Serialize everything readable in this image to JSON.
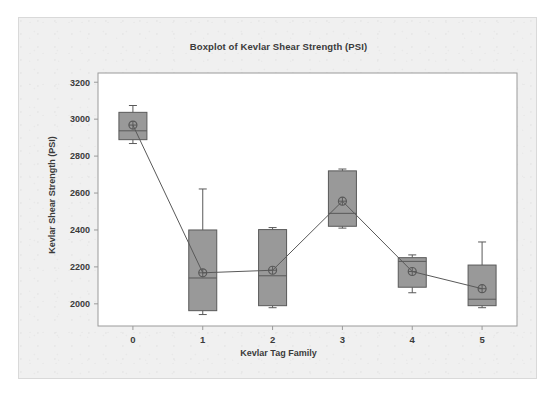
{
  "chart_data": {
    "type": "box",
    "title": "Boxplot of Kevlar Shear Strength (PSI)",
    "xlabel": "Kevlar Tag Family",
    "ylabel": "Kevlar Shear Strength (PSI)",
    "categories": [
      "0",
      "1",
      "2",
      "3",
      "4",
      "5"
    ],
    "ylim": [
      1880,
      3250
    ],
    "yticks": [
      2000,
      2200,
      2400,
      2600,
      2800,
      3000,
      3200
    ],
    "ytick_labels": [
      "2000",
      "2200",
      "2400",
      "2600",
      "2800",
      "3000",
      "3200"
    ],
    "grid": false,
    "legend": "none",
    "box_fill_color": "#999999",
    "box_edge_color": "#595959",
    "mean_line_color": "#595959",
    "panel_background": "#f0f0f0",
    "plot_background": "#ffffff",
    "boxes": [
      {
        "category": "0",
        "whisker_low": 2868,
        "q1": 2889,
        "median": 2937,
        "q3": 3037,
        "whisker_high": 3074,
        "mean": 2968
      },
      {
        "category": "1",
        "whisker_low": 1942,
        "q1": 1963,
        "median": 2140,
        "q3": 2400,
        "whisker_high": 2622,
        "mean": 2168
      },
      {
        "category": "2",
        "whisker_low": 1979,
        "q1": 1990,
        "median": 2152,
        "q3": 2402,
        "whisker_high": 2413,
        "mean": 2182
      },
      {
        "category": "3",
        "whisker_low": 2410,
        "q1": 2420,
        "median": 2490,
        "q3": 2720,
        "whisker_high": 2730,
        "mean": 2556
      },
      {
        "category": "4",
        "whisker_low": 2060,
        "q1": 2090,
        "median": 2230,
        "q3": 2250,
        "whisker_high": 2265,
        "mean": 2175
      },
      {
        "category": "5",
        "whisker_low": 1979,
        "q1": 1990,
        "median": 2025,
        "q3": 2210,
        "whisker_high": 2335,
        "mean": 2082
      }
    ],
    "mean_connector_values": [
      2968,
      2168,
      2182,
      2556,
      2175,
      2082
    ]
  }
}
